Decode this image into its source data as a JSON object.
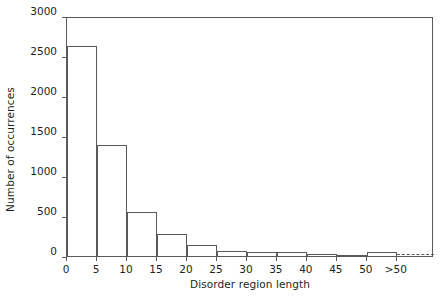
{
  "chart_data": {
    "type": "bar",
    "title": "",
    "subtitle": "",
    "xlabel": "Disorder region length",
    "ylabel": "Number of occurrences",
    "categories": [
      "0-5",
      "5-10",
      "10-15",
      "15-20",
      "20-25",
      "25-30",
      "30-35",
      "35-40",
      "40-45",
      "45-50",
      ">50"
    ],
    "bin_edges": [
      0,
      5,
      10,
      15,
      20,
      25,
      30,
      35,
      40,
      45,
      50,
      55
    ],
    "values": [
      2620,
      1390,
      545,
      270,
      140,
      65,
      50,
      45,
      25,
      5,
      45
    ],
    "xtick_labels": [
      "0",
      "5",
      "10",
      "15",
      "20",
      "25",
      "30",
      "35",
      "40",
      "45",
      "50",
      ">50"
    ],
    "xtick_positions": [
      0,
      5,
      10,
      15,
      20,
      25,
      30,
      35,
      40,
      45,
      50,
      55
    ],
    "ytick_labels": [
      "0",
      "500",
      "1000",
      "1500",
      "2000",
      "2500",
      "3000"
    ],
    "ytick_values": [
      0,
      500,
      1000,
      1500,
      2000,
      2500,
      3000
    ],
    "xlim": [
      0,
      61.2
    ],
    "ylim": [
      0,
      3000
    ],
    "grid": false,
    "legend": null,
    "annotations": [
      {
        "type": "dashed-line",
        "from_x": 55,
        "to_x": 61.2,
        "y": 45,
        "note": "open-ended tail beyond >50 bin"
      }
    ],
    "colors": {
      "line": "#5a5a5a",
      "fill": "none",
      "text": "#231f20",
      "background": "#ffffff"
    }
  }
}
